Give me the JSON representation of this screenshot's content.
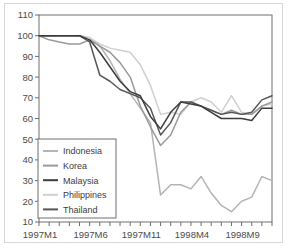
{
  "chart_data": {
    "type": "line",
    "title": "",
    "xlabel": "",
    "ylabel": "",
    "ylim": [
      10,
      110
    ],
    "ytick_values": [
      10,
      20,
      30,
      40,
      50,
      60,
      70,
      80,
      90,
      100,
      110
    ],
    "grid": false,
    "legend_position": "lower-left",
    "x": [
      "1997M1",
      "1997M2",
      "1997M3",
      "1997M4",
      "1997M5",
      "1997M6",
      "1997M7",
      "1997M8",
      "1997M9",
      "1997M10",
      "1997M11",
      "1997M12",
      "1998M1",
      "1998M2",
      "1998M3",
      "1998M4",
      "1998M5",
      "1998M6",
      "1998M7",
      "1998M8",
      "1998M9",
      "1998M10",
      "1998M11",
      "1998M12"
    ],
    "xtick_labels": [
      "1997M1",
      "1997M6",
      "1997M11",
      "1998M4",
      "1998M9"
    ],
    "xtick_indices": [
      0,
      5,
      10,
      15,
      20
    ],
    "series": [
      {
        "name": "Indonesia",
        "color": "#b4b4b4",
        "values": [
          100,
          100,
          100,
          100,
          100,
          99,
          95,
          88,
          79,
          72,
          65,
          58,
          23,
          28,
          28,
          26,
          32,
          24,
          18,
          15,
          20,
          22,
          32,
          30
        ]
      },
      {
        "name": "Korea",
        "color": "#9a9a9a",
        "values": [
          100,
          98,
          97,
          96,
          96,
          98,
          95,
          92,
          87,
          80,
          66,
          56,
          47,
          52,
          63,
          68,
          66,
          64,
          62,
          64,
          62,
          62,
          66,
          68
        ]
      },
      {
        "name": "Malaysia",
        "color": "#3c3c3c",
        "values": [
          100,
          100,
          100,
          100,
          100,
          98,
          92,
          85,
          78,
          73,
          71,
          61,
          55,
          63,
          68,
          67,
          66,
          63,
          60,
          60,
          60,
          59,
          65,
          65
        ]
      },
      {
        "name": "Philippines",
        "color": "#cfcfcf",
        "values": [
          100,
          100,
          100,
          100,
          100,
          99,
          96,
          94,
          93,
          92,
          86,
          76,
          62,
          63,
          62,
          68,
          70,
          68,
          63,
          71,
          63,
          62,
          66,
          67
        ]
      },
      {
        "name": "Thailand",
        "color": "#565656",
        "values": [
          100,
          100,
          100,
          100,
          100,
          97,
          81,
          78,
          74,
          72,
          70,
          65,
          52,
          58,
          68,
          68,
          66,
          64,
          62,
          63,
          62,
          63,
          69,
          71
        ]
      }
    ]
  }
}
